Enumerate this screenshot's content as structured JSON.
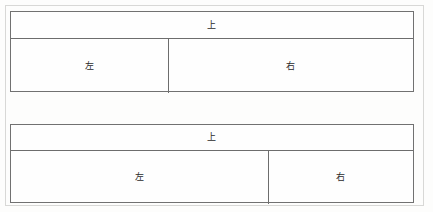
{
  "page": {
    "background_color": "#fdfdfc",
    "frame_color": "#d8d8d6",
    "line_color": "#6d6d6d",
    "text_color": "#2b2b2b"
  },
  "diagrams": [
    {
      "name": "top-diagram",
      "rows": [
        {
          "name": "header-row",
          "cells": [
            {
              "label": "上",
              "role": "top"
            }
          ]
        },
        {
          "name": "body-row",
          "cells": [
            {
              "label": "左",
              "role": "left"
            },
            {
              "label": "右",
              "role": "right"
            }
          ]
        }
      ]
    },
    {
      "name": "bottom-diagram",
      "rows": [
        {
          "name": "header-row",
          "cells": [
            {
              "label": "上",
              "role": "top"
            }
          ]
        },
        {
          "name": "body-row",
          "cells": [
            {
              "label": "左",
              "role": "left"
            },
            {
              "label": "右",
              "role": "right"
            }
          ]
        }
      ]
    }
  ]
}
